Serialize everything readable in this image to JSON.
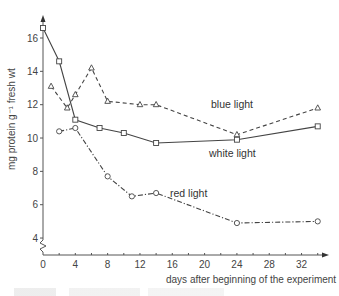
{
  "chart_data": {
    "type": "line",
    "title": "",
    "xlabel": "days after beginning of the experiment",
    "ylabel": "mg protein g⁻¹ fresh wt",
    "xlim": [
      0,
      35
    ],
    "ylim": [
      3.5,
      17
    ],
    "y_axis_break": true,
    "grid": false,
    "legend": "inline labels",
    "x_ticks": [
      0,
      4,
      8,
      12,
      16,
      20,
      24,
      28,
      32
    ],
    "y_ticks": [
      4,
      6,
      8,
      10,
      12,
      14,
      16
    ],
    "series": [
      {
        "name": "white light",
        "marker": "square",
        "line_style": "solid",
        "x": [
          0,
          2,
          4,
          7,
          10,
          14,
          24,
          34
        ],
        "values": [
          16.6,
          14.6,
          11.1,
          10.6,
          10.3,
          9.7,
          9.9,
          10.7
        ]
      },
      {
        "name": "blue light",
        "marker": "triangle",
        "line_style": "dashed",
        "x": [
          1,
          3,
          4,
          6,
          8,
          12,
          14,
          24,
          34
        ],
        "values": [
          13.1,
          11.8,
          12.6,
          14.2,
          12.2,
          12.0,
          12.0,
          10.2,
          11.8
        ]
      },
      {
        "name": "red light",
        "marker": "circle",
        "line_style": "dash-dot",
        "x": [
          2,
          4,
          8,
          11,
          14,
          24,
          34
        ],
        "values": [
          10.4,
          10.6,
          7.7,
          6.5,
          6.7,
          4.9,
          5.0
        ]
      }
    ],
    "annotations": [
      {
        "text": "blue light",
        "near_series": "blue light"
      },
      {
        "text": "white light",
        "near_series": "white light"
      },
      {
        "text": "red light",
        "near_series": "red light"
      }
    ]
  },
  "labels": {
    "xlabel": "days after beginning of the experiment",
    "ylabel": "mg protein g⁻¹ fresh wt",
    "series_white": "white light",
    "series_blue": "blue light",
    "series_red": "red light"
  }
}
